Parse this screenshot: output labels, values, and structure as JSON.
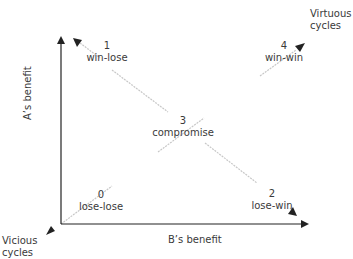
{
  "diagram": {
    "type": "payoff-quadrant",
    "axes": {
      "x_label": "B’s benefit",
      "y_label": "A’s benefit"
    },
    "corners": {
      "top_right": {
        "line1": "Virtuous",
        "line2": "cycles"
      },
      "bottom_left": {
        "line1": "Vicious",
        "line2": "cycles"
      }
    },
    "outcomes": [
      {
        "id": "0",
        "label": "lose-lose"
      },
      {
        "id": "1",
        "label": "win-lose"
      },
      {
        "id": "2",
        "label": "lose-win"
      },
      {
        "id": "3",
        "label": "compromise"
      },
      {
        "id": "4",
        "label": "win-win"
      }
    ],
    "colors": {
      "axis": "#222222",
      "diagonal": "#c8c8c8",
      "text": "#3a3a3a"
    }
  }
}
